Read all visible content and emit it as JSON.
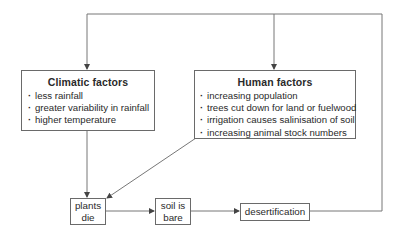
{
  "diagram": {
    "climatic": {
      "title": "Climatic factors",
      "items": [
        "less rainfall",
        "greater variability in rainfall",
        "higher temperature"
      ]
    },
    "human": {
      "title": "Human factors",
      "items": [
        "increasing population",
        "trees cut down for land or fuelwood",
        "irrigation causes salinisation of soil",
        "increasing animal stock numbers"
      ]
    },
    "nodes": {
      "plants_die": {
        "line1": "plants",
        "line2": "die"
      },
      "soil_bare": {
        "line1": "soil is",
        "line2": "bare"
      },
      "desertification": "desertification"
    },
    "colors": {
      "line": "#6a6a6a",
      "text": "#2a2a2a"
    }
  }
}
